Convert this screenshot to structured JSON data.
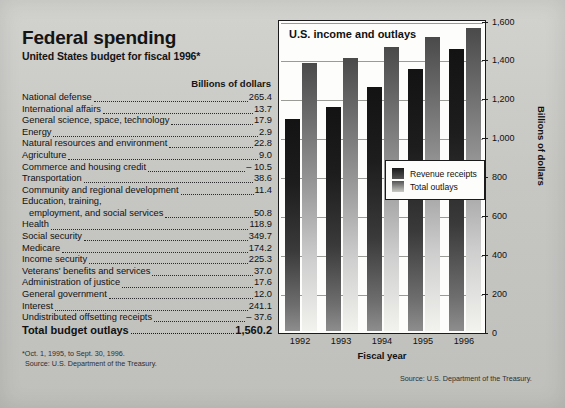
{
  "left_panel": {
    "title": "Federal spending",
    "subtitle": "United States budget for fiscal 1996*",
    "units_header": "Billions of dollars",
    "items": [
      {
        "name": "National defense",
        "value": "265.4"
      },
      {
        "name": "International affairs",
        "value": "13.7"
      },
      {
        "name": "General science, space, technology",
        "value": "17.9"
      },
      {
        "name": "Energy",
        "value": "2.9"
      },
      {
        "name": "Natural resources and environment",
        "value": "22.8"
      },
      {
        "name": "Agriculture",
        "value": "9.0"
      },
      {
        "name": "Commerce and housing credit",
        "value": "– 10.5"
      },
      {
        "name": "Transportation",
        "value": "38.6"
      },
      {
        "name": "Community and regional development",
        "value": "11.4"
      },
      {
        "name": "Education, training,",
        "name2": "employment, and social services",
        "value": "50.8",
        "wrap": true
      },
      {
        "name": "Health",
        "value": "118.9"
      },
      {
        "name": "Social security",
        "value": "349.7"
      },
      {
        "name": "Medicare",
        "value": "174.2"
      },
      {
        "name": "Income security",
        "value": "225.3"
      },
      {
        "name": "Veterans' benefits and services",
        "value": "37.0"
      },
      {
        "name": "Administration of justice",
        "value": "17.6"
      },
      {
        "name": "General government",
        "value": "12.0"
      },
      {
        "name": "Interest",
        "value": "241.1"
      },
      {
        "name": "Undistributed offsetting receipts",
        "value": "– 37.6"
      }
    ],
    "total": {
      "name": "Total budget outlays",
      "value": "1,560.2"
    },
    "footnote_1": "*Oct. 1, 1995, to Sept. 30, 1996.",
    "footnote_2": "Source: U.S. Department of the Treasury."
  },
  "chart_data": {
    "type": "bar",
    "title": "U.S. income and outlays",
    "xlabel": "Fiscal year",
    "ylabel": "Billions of dollars",
    "categories": [
      "1992",
      "1993",
      "1994",
      "1995",
      "1996"
    ],
    "series": [
      {
        "name": "Revenue receipts",
        "values": [
          1091,
          1154,
          1258,
          1351,
          1453
        ]
      },
      {
        "name": "Total outlays",
        "values": [
          1381,
          1409,
          1461,
          1515,
          1560
        ]
      }
    ],
    "ylim": [
      0,
      1600
    ],
    "yticks": [
      "0",
      "200",
      "400",
      "600",
      "800",
      "1,000",
      "1,200",
      "1,400",
      "1,600"
    ],
    "ytick_values": [
      0,
      200,
      400,
      600,
      800,
      1000,
      1200,
      1400,
      1600
    ],
    "grid": true,
    "legend_position": "center-right-inside",
    "source": "Source: U.S. Department of the Treasury."
  }
}
